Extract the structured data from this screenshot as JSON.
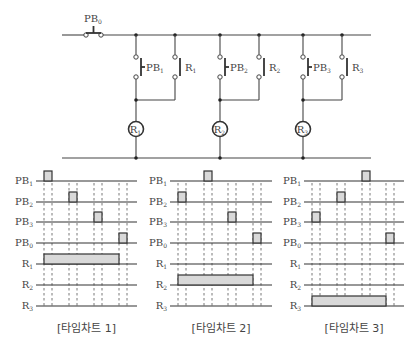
{
  "circuit": {
    "pushbutton_main": {
      "label": "PB",
      "sub": "0"
    },
    "top_rail_y": 35,
    "bottom_rail_y": 158,
    "rail_x": [
      62,
      371
    ],
    "branches": [
      {
        "pb": {
          "label": "PB",
          "sub": "1"
        },
        "contact": {
          "label": "R",
          "sub": "1"
        },
        "coil": {
          "label": "R",
          "sub": "1"
        },
        "x_pb": 136,
        "x_r": 175
      },
      {
        "pb": {
          "label": "PB",
          "sub": "2"
        },
        "contact": {
          "label": "R",
          "sub": "2"
        },
        "coil": {
          "label": "R",
          "sub": "2"
        },
        "x_pb": 220,
        "x_r": 259
      },
      {
        "pb": {
          "label": "PB",
          "sub": "3"
        },
        "contact": {
          "label": "R",
          "sub": "3"
        },
        "coil": {
          "label": "R",
          "sub": "3"
        },
        "x_pb": 303,
        "x_r": 342
      }
    ]
  },
  "timing_charts": [
    {
      "caption": "[타임차트 1]",
      "x0": 36,
      "x1": 137,
      "label_x": 33,
      "dashes": [
        44,
        52,
        69,
        77,
        94,
        102,
        119,
        127
      ],
      "rows": [
        {
          "label": "PB",
          "sub": "1",
          "pulses": [
            [
              44,
              52
            ]
          ]
        },
        {
          "label": "PB",
          "sub": "2",
          "pulses": [
            [
              69,
              77
            ]
          ]
        },
        {
          "label": "PB",
          "sub": "3",
          "pulses": [
            [
              94,
              102
            ]
          ]
        },
        {
          "label": "PB",
          "sub": "0",
          "pulses": [
            [
              119,
              127
            ]
          ]
        },
        {
          "label": "R",
          "sub": "1",
          "pulses": [
            [
              44,
              119
            ]
          ]
        },
        {
          "label": "R",
          "sub": "2",
          "pulses": []
        },
        {
          "label": "R",
          "sub": "3",
          "pulses": []
        }
      ]
    },
    {
      "caption": "[타임차트 2]",
      "x0": 170,
      "x1": 272,
      "label_x": 167,
      "dashes": [
        178,
        186,
        204,
        212,
        228,
        236,
        253,
        261
      ],
      "rows": [
        {
          "label": "PB",
          "sub": "1",
          "pulses": [
            [
              204,
              212
            ]
          ]
        },
        {
          "label": "PB",
          "sub": "2",
          "pulses": [
            [
              178,
              186
            ]
          ]
        },
        {
          "label": "PB",
          "sub": "3",
          "pulses": [
            [
              228,
              236
            ]
          ]
        },
        {
          "label": "PB",
          "sub": "0",
          "pulses": [
            [
              253,
              261
            ]
          ]
        },
        {
          "label": "R",
          "sub": "1",
          "pulses": []
        },
        {
          "label": "R",
          "sub": "2",
          "pulses": [
            [
              178,
              253
            ]
          ]
        },
        {
          "label": "R",
          "sub": "3",
          "pulses": []
        }
      ]
    },
    {
      "caption": "[타임차트 3]",
      "x0": 304,
      "x1": 404,
      "label_x": 301,
      "dashes": [
        312,
        320,
        337,
        345,
        362,
        370,
        386,
        394
      ],
      "rows": [
        {
          "label": "PB",
          "sub": "1",
          "pulses": [
            [
              362,
              370
            ]
          ]
        },
        {
          "label": "PB",
          "sub": "2",
          "pulses": [
            [
              337,
              345
            ]
          ]
        },
        {
          "label": "PB",
          "sub": "3",
          "pulses": [
            [
              312,
              320
            ]
          ]
        },
        {
          "label": "PB",
          "sub": "0",
          "pulses": [
            [
              386,
              394
            ]
          ]
        },
        {
          "label": "R",
          "sub": "1",
          "pulses": []
        },
        {
          "label": "R",
          "sub": "2",
          "pulses": []
        },
        {
          "label": "R",
          "sub": "3",
          "pulses": [
            [
              312,
              386
            ]
          ]
        }
      ]
    }
  ],
  "timing_layout": {
    "row_y": [
      181,
      202,
      222,
      243,
      264,
      285,
      306
    ],
    "pulse_height": 10,
    "dash_top": 183,
    "dash_bottom": 306,
    "caption_y": 332
  }
}
